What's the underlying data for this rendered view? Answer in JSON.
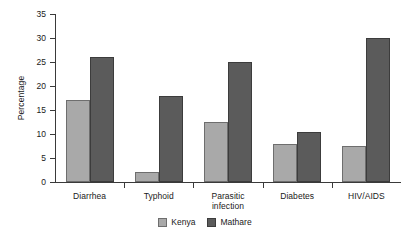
{
  "chart_data": {
    "type": "bar",
    "title": "",
    "xlabel": "",
    "ylabel": "Percentage",
    "ylim": [
      0,
      35
    ],
    "yticks": [
      0,
      5,
      10,
      15,
      20,
      25,
      30,
      35
    ],
    "grid": false,
    "legend_position": "bottom-center",
    "categories": [
      "Diarrhea",
      "Typhoid",
      "Parasitic infection",
      "Diabetes",
      "HIV/AIDS"
    ],
    "series": [
      {
        "name": "Kenya",
        "color": "#a9a9a9",
        "values": [
          17,
          2,
          12.5,
          8,
          7.5
        ]
      },
      {
        "name": "Mathare",
        "color": "#5b5b5b",
        "values": [
          26,
          18,
          25,
          10.5,
          30
        ]
      }
    ]
  },
  "axis": {
    "y_title": "Percentage",
    "y_tick_labels": [
      "35",
      "30",
      "25",
      "20",
      "15",
      "10",
      "5",
      "0"
    ]
  },
  "categories": [
    {
      "line1": "Diarrhea",
      "line2": ""
    },
    {
      "line1": "Typhoid",
      "line2": ""
    },
    {
      "line1": "Parasitic",
      "line2": "infection"
    },
    {
      "line1": "Diabetes",
      "line2": ""
    },
    {
      "line1": "HIV/AIDS",
      "line2": ""
    }
  ],
  "legend": {
    "items": [
      {
        "label": "Kenya"
      },
      {
        "label": "Mathare"
      }
    ]
  }
}
